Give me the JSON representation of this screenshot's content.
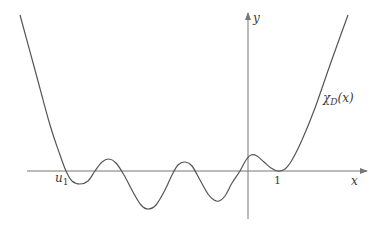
{
  "chart_data": {
    "type": "line",
    "title": "",
    "xlabel": "x",
    "ylabel": "y",
    "curve_label": "χ_D(x)",
    "curve_label_main": "χ",
    "curve_label_sub": "D",
    "curve_label_arg": "(x)",
    "annotations": [
      {
        "text": "u",
        "subscript": "1",
        "meaning": "leftmost root u_1 on x-axis"
      },
      {
        "text": "1",
        "meaning": "tick at x = 1 where curve touches x-axis (double root)"
      }
    ],
    "grid": false,
    "legend": "none",
    "axis_color": "#777777",
    "curve_color": "#555555",
    "points_px": [
      [
        20,
        15
      ],
      [
        35,
        70
      ],
      [
        50,
        125
      ],
      [
        60,
        155
      ],
      [
        66,
        171
      ],
      [
        72,
        181
      ],
      [
        80,
        184
      ],
      [
        88,
        181
      ],
      [
        95,
        171
      ],
      [
        102,
        162
      ],
      [
        109,
        159
      ],
      [
        116,
        163
      ],
      [
        124,
        175
      ],
      [
        133,
        192
      ],
      [
        141,
        205
      ],
      [
        148,
        209
      ],
      [
        156,
        205
      ],
      [
        165,
        190
      ],
      [
        172,
        175
      ],
      [
        178,
        165
      ],
      [
        185,
        162
      ],
      [
        192,
        166
      ],
      [
        200,
        180
      ],
      [
        208,
        194
      ],
      [
        214,
        200
      ],
      [
        219,
        201
      ],
      [
        225,
        196
      ],
      [
        232,
        183
      ],
      [
        240,
        171
      ],
      [
        246,
        160
      ],
      [
        251,
        155
      ],
      [
        257,
        156
      ],
      [
        264,
        162
      ],
      [
        271,
        168
      ],
      [
        278,
        171
      ],
      [
        285,
        169
      ],
      [
        292,
        160
      ],
      [
        302,
        140
      ],
      [
        315,
        108
      ],
      [
        330,
        65
      ],
      [
        348,
        15
      ]
    ],
    "axes_px": {
      "x_axis": {
        "y": 171,
        "x_start": 27,
        "x_end": 367
      },
      "y_axis": {
        "x": 248,
        "y_start": 219,
        "y_end": 13
      }
    }
  },
  "labels": {
    "y_axis": "y",
    "x_axis": "x",
    "root_u": "u",
    "root_u_sub": "1",
    "tick_one": "1",
    "chi": "χ",
    "chi_sub": "D",
    "chi_arg": "(x)"
  }
}
